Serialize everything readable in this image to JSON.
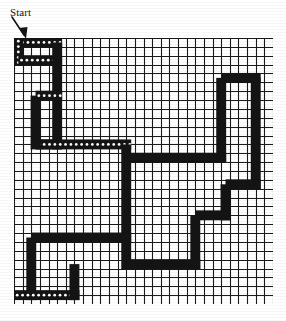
{
  "figure": {
    "kind": "maze-diagram",
    "title_label": "Start",
    "start_marker": "down-arrow",
    "background_color": "#ffffff",
    "ink_color": "#141414",
    "grid": {
      "columns": 30,
      "rows": 30,
      "cell_px": 8.6,
      "line_color": "#1a1a1a",
      "line_width_px": 1.1,
      "origin_x_px": 14,
      "origin_y_px": 38,
      "width_px": 259,
      "height_px": 266
    },
    "path": {
      "stroke_color": "#141414",
      "stroke_width_cells": 1.15,
      "description": "Thick black walk drawn over the grid",
      "segments": [
        {
          "name": "start-stub-top",
          "type": "h",
          "row": 0.5,
          "c1": 0.0,
          "c2": 5.0,
          "texture": "dotted"
        },
        {
          "name": "start-down",
          "type": "v",
          "col": 0.5,
          "r1": 0.0,
          "r2": 2.5,
          "texture": "dotted"
        },
        {
          "name": "start-right",
          "type": "h",
          "row": 2.5,
          "c1": 0.5,
          "c2": 5.0,
          "texture": "dotted"
        },
        {
          "name": "col5-down",
          "type": "v",
          "col": 5.0,
          "r1": 0.5,
          "r2": 12.0,
          "texture": "solid"
        },
        {
          "name": "row12-right",
          "type": "h",
          "row": 12.0,
          "c1": 2.5,
          "c2": 5.0,
          "texture": "dotted"
        },
        {
          "name": "row12-back-left",
          "type": "h",
          "row": 12.0,
          "c1": 2.5,
          "c2": 13.0,
          "texture": "dotted"
        },
        {
          "name": "col2_5-up",
          "type": "v",
          "col": 2.5,
          "r1": 6.5,
          "r2": 12.0,
          "texture": "solid"
        },
        {
          "name": "row6_5-right",
          "type": "h",
          "row": 6.5,
          "c1": 2.5,
          "c2": 5.0,
          "texture": "dotted"
        },
        {
          "name": "row13-long",
          "type": "h",
          "row": 13.5,
          "c1": 13.0,
          "c2": 24.0,
          "texture": "solid"
        },
        {
          "name": "col13-down",
          "type": "v",
          "col": 13.0,
          "r1": 12.0,
          "r2": 25.5,
          "texture": "solid"
        },
        {
          "name": "col24-up",
          "type": "v",
          "col": 24.0,
          "r1": 4.5,
          "r2": 13.5,
          "texture": "solid"
        },
        {
          "name": "row4_5-right",
          "type": "h",
          "row": 4.5,
          "c1": 24.0,
          "c2": 28.0,
          "texture": "solid"
        },
        {
          "name": "col28-down",
          "type": "v",
          "col": 28.0,
          "r1": 4.5,
          "r2": 16.5,
          "texture": "solid"
        },
        {
          "name": "row16_5-left",
          "type": "h",
          "row": 16.5,
          "c1": 24.5,
          "c2": 28.0,
          "texture": "solid"
        },
        {
          "name": "col24_5-down",
          "type": "v",
          "col": 24.5,
          "r1": 16.5,
          "r2": 20.0,
          "texture": "solid"
        },
        {
          "name": "row20-left",
          "type": "h",
          "row": 20.0,
          "c1": 21.0,
          "c2": 24.5,
          "texture": "solid"
        },
        {
          "name": "col21-down",
          "type": "v",
          "col": 21.0,
          "r1": 20.0,
          "r2": 25.5,
          "texture": "solid"
        },
        {
          "name": "row25_5-left",
          "type": "h",
          "row": 25.5,
          "c1": 13.0,
          "c2": 21.0,
          "texture": "solid"
        },
        {
          "name": "row22_5-left",
          "type": "h",
          "row": 22.5,
          "c1": 2.0,
          "c2": 13.0,
          "texture": "solid"
        },
        {
          "name": "col2-down",
          "type": "v",
          "col": 2.0,
          "r1": 22.5,
          "r2": 29.0,
          "texture": "solid"
        },
        {
          "name": "row29-exit",
          "type": "h",
          "row": 29.0,
          "c1": 0.0,
          "c2": 7.0,
          "texture": "dotted"
        },
        {
          "name": "col7-stub",
          "type": "v",
          "col": 7.0,
          "r1": 25.5,
          "r2": 29.0,
          "texture": "solid"
        }
      ]
    }
  }
}
